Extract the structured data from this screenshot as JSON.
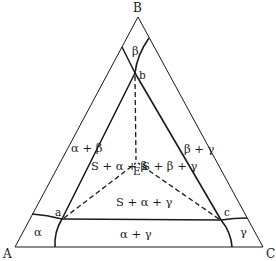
{
  "diagram": {
    "type": "ternary-phase-diagram",
    "vertices": {
      "A": "A",
      "B": "B",
      "C": "C"
    },
    "points": {
      "a": "a",
      "b": "b",
      "c": "c",
      "E": "E"
    },
    "phase_regions": {
      "alpha": "α",
      "beta": "β",
      "gamma": "γ",
      "alpha_beta": "α + β",
      "beta_gamma": "β + γ",
      "alpha_gamma": "α + γ",
      "s_alpha_beta": "S + α + β",
      "s_beta_gamma": "S + β + γ",
      "s_alpha_gamma": "S + α + γ"
    },
    "colors": {
      "line": "#1a1a1a",
      "background": "#ffffff"
    }
  }
}
